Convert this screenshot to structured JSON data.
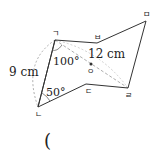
{
  "diagram": {
    "vertices": {
      "giyeok": {
        "label": "ㄱ",
        "x": 55,
        "y": 40
      },
      "bieup": {
        "label": "ㅂ",
        "x": 97,
        "y": 43
      },
      "mieum": {
        "label": "ㅁ",
        "x": 146,
        "y": 21
      },
      "rieul": {
        "label": "ㄹ",
        "x": 128,
        "y": 88
      },
      "digeut": {
        "label": "ㄷ",
        "x": 86,
        "y": 84
      },
      "nieun": {
        "label": "ㄴ",
        "x": 38,
        "y": 107
      },
      "ieung": {
        "label": "ㅇ",
        "x": 91,
        "y": 64
      }
    },
    "measures": {
      "side_left": "9 cm",
      "diagonal": "12 cm",
      "angle_top": "100°",
      "angle_bottom": "50°"
    },
    "answer_paren": "("
  }
}
